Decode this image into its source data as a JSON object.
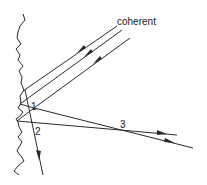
{
  "diagram": {
    "labels": {
      "beam": "coherent",
      "point1": "1",
      "point2": "2",
      "point3": "3"
    },
    "elements": [
      {
        "id": "rough-surface",
        "kind": "wavy-boundary"
      },
      {
        "id": "incident-beam-1",
        "kind": "incident-ray",
        "arrow": "inward"
      },
      {
        "id": "incident-beam-2",
        "kind": "incident-ray",
        "arrow": "inward"
      },
      {
        "id": "incident-beam-3",
        "kind": "incident-ray",
        "arrow": "inward"
      },
      {
        "id": "scattered-ray-downward",
        "kind": "scattered-ray",
        "arrow": "outward"
      },
      {
        "id": "scattered-ray-a",
        "kind": "scattered-ray",
        "arrow": "outward"
      },
      {
        "id": "scattered-ray-b",
        "kind": "scattered-ray",
        "arrow": "outward"
      }
    ],
    "colors": {
      "stroke": "#2a2a2a",
      "background": "#ffffff"
    }
  }
}
